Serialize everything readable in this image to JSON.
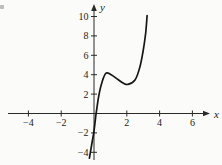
{
  "figure": {
    "background": "#fbfbf9",
    "axis_color": "#2a2a28",
    "label_color": "#1c1c1a"
  },
  "chart_data": {
    "type": "line",
    "title": "",
    "xlabel": "x",
    "ylabel": "y",
    "xlim": [
      -4.9,
      7.1
    ],
    "ylim": [
      -4.8,
      11.2
    ],
    "grid": false,
    "legend": false,
    "x_ticks": [
      {
        "value": -4,
        "label": "−4"
      },
      {
        "value": -2,
        "label": "−2"
      },
      {
        "value": 2,
        "label": "2"
      },
      {
        "value": 4,
        "label": "4"
      },
      {
        "value": 6,
        "label": "6"
      }
    ],
    "y_ticks": [
      {
        "value": 10,
        "label": "10"
      },
      {
        "value": 8,
        "label": "8"
      },
      {
        "value": 6,
        "label": "6"
      },
      {
        "value": 4,
        "label": "4"
      },
      {
        "value": 2,
        "label": "2"
      },
      {
        "value": -2,
        "label": "−2"
      },
      {
        "value": -4,
        "label": "−4"
      }
    ],
    "series": [
      {
        "name": "curve",
        "color": "#161614",
        "stroke_width": 1.7,
        "points": [
          [
            -0.28,
            -4.6
          ],
          [
            -0.16,
            -3.4
          ],
          [
            0.0,
            -1.8
          ],
          [
            0.13,
            0.0
          ],
          [
            0.3,
            1.9
          ],
          [
            0.5,
            3.3
          ],
          [
            0.73,
            4.15
          ],
          [
            1.05,
            4.0
          ],
          [
            1.5,
            3.45
          ],
          [
            1.8,
            3.12
          ],
          [
            2.07,
            3.0
          ],
          [
            2.5,
            3.45
          ],
          [
            2.8,
            4.8
          ],
          [
            3.0,
            6.5
          ],
          [
            3.15,
            8.3
          ],
          [
            3.24,
            10.1
          ]
        ]
      }
    ],
    "features": {
      "local_max": [
        0.73,
        4.15
      ],
      "local_min": [
        2.07,
        3.0
      ],
      "x_intercept": 0.13,
      "y_intercept": -1.8
    }
  }
}
